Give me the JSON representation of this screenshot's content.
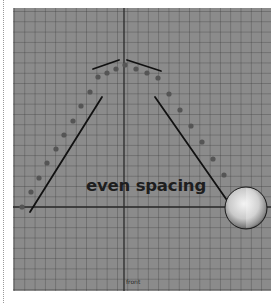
{
  "figure": {
    "caption": "even spacing",
    "camera_label": "front",
    "colors": {
      "viewport_bg": "#8b8b8b",
      "grid_line": "#5a5a5a",
      "axis_line": "#2a2a2a",
      "dot": "#555555",
      "stroke": "#111111",
      "caption": "#1e1e1e"
    },
    "axes": {
      "vertical_x": 111,
      "horizontal_y": 199
    },
    "trajectory_dots": [
      {
        "x": 9,
        "y": 199
      },
      {
        "x": 18,
        "y": 184
      },
      {
        "x": 26,
        "y": 170
      },
      {
        "x": 34,
        "y": 155
      },
      {
        "x": 43,
        "y": 141
      },
      {
        "x": 51,
        "y": 127
      },
      {
        "x": 60,
        "y": 113
      },
      {
        "x": 68,
        "y": 98
      },
      {
        "x": 77,
        "y": 84
      },
      {
        "x": 85,
        "y": 69
      },
      {
        "x": 94,
        "y": 65
      },
      {
        "x": 103,
        "y": 61
      },
      {
        "x": 112,
        "y": 57
      },
      {
        "x": 123,
        "y": 61
      },
      {
        "x": 134,
        "y": 65
      },
      {
        "x": 145,
        "y": 70
      },
      {
        "x": 156,
        "y": 86
      },
      {
        "x": 167,
        "y": 102
      },
      {
        "x": 178,
        "y": 118
      },
      {
        "x": 189,
        "y": 134
      },
      {
        "x": 200,
        "y": 151
      },
      {
        "x": 211,
        "y": 167
      }
    ],
    "guide_lines": [
      {
        "name": "left-rise-line",
        "x1": 17,
        "y1": 204,
        "x2": 89,
        "y2": 89
      },
      {
        "name": "right-fall-line",
        "x1": 142,
        "y1": 89,
        "x2": 218,
        "y2": 198
      },
      {
        "name": "left-apex-tangent",
        "x1": 80,
        "y1": 61,
        "x2": 106,
        "y2": 52
      },
      {
        "name": "right-apex-tangent",
        "x1": 114,
        "y1": 52,
        "x2": 148,
        "y2": 63
      }
    ],
    "ball": {
      "cx": 233,
      "cy": 200,
      "r": 21
    }
  }
}
